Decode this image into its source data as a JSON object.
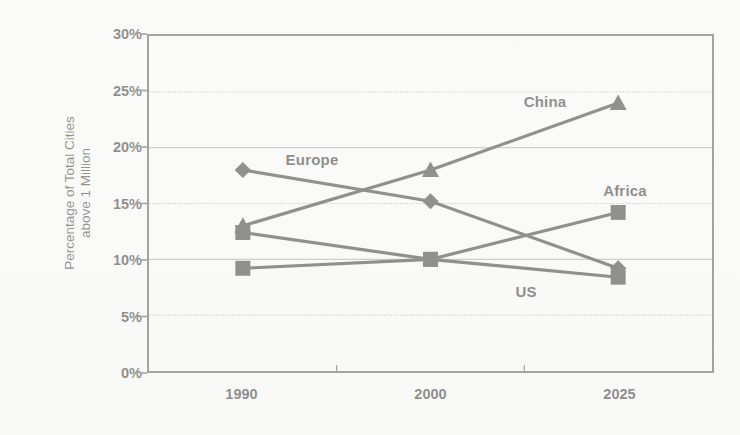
{
  "chart_data": {
    "type": "line",
    "title": "",
    "subtitle": "",
    "xlabel": "",
    "ylabel": "Percentage of Total Cities above 1 Million",
    "ylabel_lines": [
      "Percentage of Total Cities",
      "above 1 Million"
    ],
    "categories": [
      "1990",
      "2000",
      "2025"
    ],
    "xtick_labels": [
      "1990",
      "2000",
      "2025"
    ],
    "ytick_labels": [
      "30%",
      "25%",
      "20%",
      "15%",
      "10%",
      "5%",
      "0%"
    ],
    "ytick_values": [
      30,
      25,
      20,
      15,
      10,
      5,
      0
    ],
    "ylim": [
      0,
      30
    ],
    "y_unit": "%",
    "grid": "horizontal",
    "legend": "inline-labels",
    "series": [
      {
        "name": "China",
        "label": "China",
        "marker": "triangle",
        "values": [
          13.0,
          18.0,
          24.0
        ],
        "label_position": {
          "x": 545,
          "y": 101
        }
      },
      {
        "name": "Europe",
        "label": "Europe",
        "marker": "diamond",
        "values": [
          18.0,
          15.2,
          9.2
        ],
        "label_position": {
          "x": 312,
          "y": 159
        }
      },
      {
        "name": "Africa",
        "label": "Africa",
        "marker": "square",
        "values": [
          9.2,
          10.0,
          14.2
        ],
        "label_position": {
          "x": 625,
          "y": 190
        }
      },
      {
        "name": "US",
        "label": "US",
        "marker": "square",
        "values": [
          12.4,
          10.0,
          8.4
        ],
        "label_position": {
          "x": 526,
          "y": 291
        }
      }
    ]
  },
  "style": {
    "line_color": "#111111",
    "marker_color": "#111111",
    "axis_color": "#3b3b3b",
    "grid_color": "#9b9b9b",
    "text_color": "#0b0b0b",
    "background": "#fbfbfa"
  }
}
